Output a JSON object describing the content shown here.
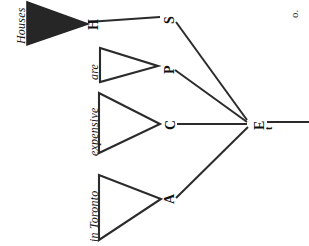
{
  "figure": {
    "orientation": "rotated-90-ccw",
    "background_color": "#ffffff",
    "ink_color": "#1a1a1a",
    "corner_mark": "o."
  },
  "phrases": [
    {
      "id": "houses",
      "label": "Houses",
      "triangle": "filled"
    },
    {
      "id": "are",
      "label": "are",
      "triangle": "outline"
    },
    {
      "id": "expensive",
      "label": "expensive",
      "triangle": "outline"
    },
    {
      "id": "inToronto",
      "label": "in Toronto",
      "triangle": "outline"
    }
  ],
  "nodes": [
    {
      "id": "s",
      "label": "S"
    },
    {
      "id": "p",
      "label": "P"
    },
    {
      "id": "c",
      "label": "C"
    },
    {
      "id": "a",
      "label": "A"
    },
    {
      "id": "et",
      "label": "E",
      "subscript": "t"
    }
  ],
  "edges": [
    {
      "from": "s",
      "to": "et"
    },
    {
      "from": "p",
      "to": "et"
    },
    {
      "from": "c",
      "to": "et"
    },
    {
      "from": "a",
      "to": "et"
    },
    {
      "from": "et",
      "to": "root"
    }
  ]
}
